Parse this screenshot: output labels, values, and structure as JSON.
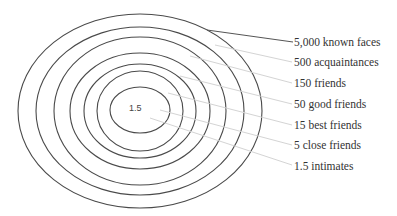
{
  "diagram": {
    "type": "concentric-ellipses",
    "center_label": "1.5",
    "center": {
      "x": 140,
      "y": 111
    },
    "rings": [
      {
        "rx": 122,
        "ry": 97
      },
      {
        "rx": 104,
        "ry": 84
      },
      {
        "rx": 86,
        "ry": 74
      },
      {
        "rx": 70,
        "ry": 58
      },
      {
        "rx": 56,
        "ry": 47
      },
      {
        "rx": 43,
        "ry": 40
      },
      {
        "rx": 30,
        "ry": 23
      }
    ],
    "labels": [
      {
        "text": "5,000 known faces",
        "top": 35
      },
      {
        "text": "500 acquaintances",
        "top": 55
      },
      {
        "text": "150 friends",
        "top": 76
      },
      {
        "text": "50 good friends",
        "top": 97
      },
      {
        "text": "15 best friends",
        "top": 118
      },
      {
        "text": "5 close friends",
        "top": 138
      },
      {
        "text": "1.5 intimates",
        "top": 159
      }
    ],
    "colors": {
      "ring": "#4a4a4a",
      "leader": "#d4d4d4",
      "text": "#333333"
    }
  }
}
